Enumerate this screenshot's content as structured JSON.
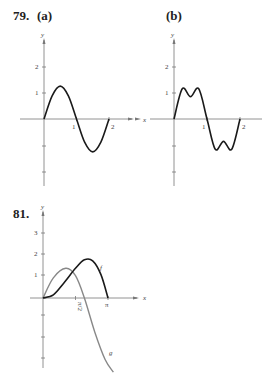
{
  "labels": {
    "p79": "79.",
    "a": "(a)",
    "b": "(b)",
    "p81": "81."
  },
  "colors": {
    "black_curve": "#1a1a1a",
    "gray_curve": "#888888",
    "axis": "#777777"
  },
  "chart_data": [
    {
      "id": "79a",
      "type": "line",
      "title": "(a)",
      "xlabel": "x",
      "ylabel": "y",
      "x_ticks": [
        "1",
        "2"
      ],
      "y_ticks": [
        "1",
        "2"
      ],
      "xlim": [
        0,
        2.6
      ],
      "ylim": [
        -2.5,
        3
      ],
      "series": [
        {
          "name": "curve",
          "x": [
            0,
            0.25,
            0.5,
            0.75,
            1,
            1.25,
            1.5,
            1.75,
            2
          ],
          "y": [
            0,
            0.88,
            1.25,
            0.88,
            0,
            -0.88,
            -1.25,
            -0.88,
            0
          ]
        }
      ]
    },
    {
      "id": "79b",
      "type": "line",
      "title": "(b)",
      "xlabel": "x",
      "ylabel": "y",
      "x_ticks": [
        "1",
        "2"
      ],
      "y_ticks": [
        "1",
        "2"
      ],
      "xlim": [
        0,
        2.6
      ],
      "ylim": [
        -2.5,
        3
      ],
      "series": [
        {
          "name": "curve",
          "x": [
            0,
            0.25,
            0.5,
            0.75,
            1,
            1.25,
            1.5,
            1.75,
            2
          ],
          "y": [
            0,
            1.15,
            0.85,
            1.15,
            0,
            -1.15,
            -0.85,
            -1.15,
            0
          ]
        }
      ]
    },
    {
      "id": "81",
      "type": "line",
      "title": "81.",
      "xlabel": "x",
      "ylabel": "y",
      "x_ticks": [
        "π/2",
        "π"
      ],
      "y_ticks": [
        "1",
        "2",
        "3"
      ],
      "xlim": [
        0,
        4.6
      ],
      "ylim": [
        -3.5,
        4
      ],
      "series": [
        {
          "name": "f",
          "x": [
            0,
            0.5,
            1.0,
            1.57,
            2.0,
            2.4,
            2.8,
            3.14
          ],
          "y": [
            0,
            0.15,
            0.7,
            1.4,
            1.8,
            1.75,
            1.1,
            0
          ]
        },
        {
          "name": "g",
          "x": [
            0,
            0.5,
            1.1,
            1.57,
            2.0,
            2.5,
            3.0,
            3.4
          ],
          "y": [
            0,
            0.95,
            1.4,
            1.05,
            0,
            -1.6,
            -2.9,
            -3.5
          ]
        }
      ]
    }
  ]
}
